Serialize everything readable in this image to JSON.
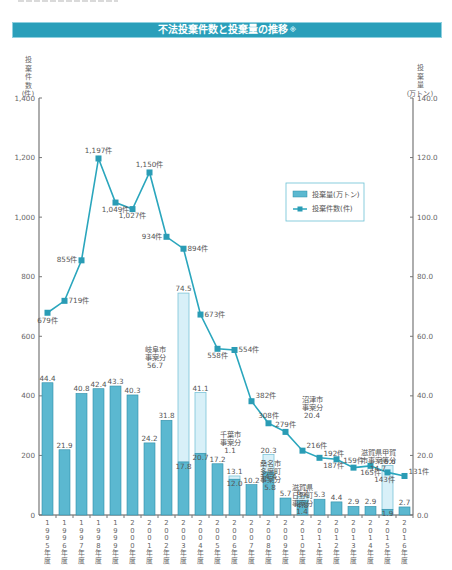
{
  "header": {
    "title": "不法投棄件数と投棄量の推移",
    "title_mark": "※"
  },
  "legend": {
    "bar_label": "投棄量(万トン)",
    "line_label": "投棄件数(件)"
  },
  "axes": {
    "left_title": [
      "投",
      "棄",
      "件",
      "数",
      "(件)"
    ],
    "right_title": [
      "投",
      "棄",
      "量",
      "(万トン)"
    ],
    "left_ticks": [
      "0",
      "200",
      "400",
      "600",
      "800",
      "1,000",
      "1,200",
      "1,400"
    ],
    "right_ticks": [
      "0.0",
      "20.0",
      "40.0",
      "60.0",
      "80.0",
      "100.0",
      "120.0",
      "140.0"
    ]
  },
  "colors": {
    "title_bg": "#2a9fba",
    "bar": "#5bb8d0",
    "bar_stroke": "#2f8ea8",
    "bar_extra": "#d8f0f8",
    "line": "#2aa6bd",
    "marker": "#2a9cb5"
  },
  "chart_data": {
    "type": "bar+line",
    "title": "不法投棄件数と投棄量の推移",
    "categories": [
      "1995年度",
      "1996年度",
      "1997年度",
      "1998年度",
      "1999年度",
      "2000年度",
      "2001年度",
      "2002年度",
      "2003年度",
      "2004年度",
      "2005年度",
      "2006年度",
      "2007年度",
      "2008年度",
      "2009年度",
      "2010年度",
      "2011年度",
      "2012年度",
      "2013年度",
      "2014年度",
      "2015年度",
      "2016年度"
    ],
    "series": [
      {
        "name": "投棄量(万トン)",
        "type": "bar",
        "axis": "right",
        "values": [
          44.4,
          21.9,
          40.8,
          42.4,
          43.3,
          40.3,
          24.2,
          31.8,
          74.5,
          41.1,
          17.2,
          13.1,
          10.2,
          20.3,
          5.7,
          6.2,
          5.3,
          4.4,
          2.9,
          2.9,
          16.6,
          2.7
        ],
        "base_values": [
          44.4,
          21.9,
          40.8,
          42.4,
          43.3,
          40.3,
          24.2,
          31.8,
          17.8,
          20.7,
          17.2,
          12.0,
          10.2,
          14.4,
          5.7,
          4.8,
          5.3,
          4.4,
          2.9,
          2.9,
          1.9,
          2.7
        ],
        "labels": [
          "44.4",
          "21.9",
          "40.8",
          "42.4",
          "43.3",
          "40.3",
          "24.2",
          "31.8",
          "74.5",
          "41.1",
          "17.2",
          "13.1",
          "10.2",
          "20.3",
          "5.7",
          "6.2",
          "5.3",
          "4.4",
          "2.9",
          "2.9",
          "16.6",
          "2.7"
        ],
        "base_labels": {
          "8": "17.8",
          "9": "20.7",
          "11": "12.0",
          "13": "14.4",
          "15": "4.8",
          "20": "1.9"
        }
      },
      {
        "name": "投棄件数(件)",
        "type": "line",
        "axis": "left",
        "values": [
          679,
          719,
          855,
          1197,
          1049,
          1027,
          1150,
          934,
          894,
          673,
          558,
          554,
          382,
          308,
          279,
          216,
          192,
          187,
          159,
          165,
          143,
          131
        ],
        "labels": [
          "679件",
          "719件",
          "855件",
          "1,197件",
          "1,049件",
          "1,027件",
          "1,150件",
          "934件",
          "894件",
          "673件",
          "558件",
          "554件",
          "382件",
          "308件",
          "279件",
          "216件",
          "192件",
          "187件",
          "159件",
          "165件",
          "143件",
          "131件"
        ]
      }
    ],
    "annotations": [
      {
        "year": "2003年度",
        "text": [
          "岐阜市",
          "事案分",
          "56.7"
        ]
      },
      {
        "year": "2004年度",
        "text": [
          "沼津市",
          "事案分",
          "20.4"
        ]
      },
      {
        "year": "2006年度",
        "text": [
          "千葉市",
          "事案分",
          "1.1"
        ]
      },
      {
        "year": "2008年度",
        "text": [
          "桑名市",
          "多度町",
          "事案分",
          "5.8"
        ]
      },
      {
        "year": "2010年度",
        "text": [
          "滋賀県",
          "日野町",
          "事案分",
          "1.4"
        ]
      },
      {
        "year": "2015年度",
        "text": [
          "滋賀県甲賀",
          "市事案等分",
          "14.7"
        ]
      }
    ],
    "ylabel_left": "投棄件数(件)",
    "ylabel_right": "投棄量(万トン)",
    "ylim_left": [
      0,
      1400
    ],
    "ylim_right": [
      0,
      140
    ],
    "legend_position": "upper right",
    "grid": false
  }
}
